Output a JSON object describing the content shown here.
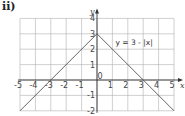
{
  "part_label": "ii)",
  "equation_label": "y = 3 - |x|",
  "axis": {
    "x_label": "x",
    "y_label": "y"
  },
  "colors": {
    "grid": "#b0b0b0",
    "axis": "#333333",
    "line": "#555555"
  },
  "chart_data": {
    "type": "line",
    "title": "",
    "xlabel": "x",
    "ylabel": "y",
    "xlim": [
      -5,
      5
    ],
    "ylim": [
      -2,
      4
    ],
    "grid": true,
    "x_ticks": [
      -5,
      -4,
      -3,
      -2,
      -1,
      0,
      1,
      2,
      3,
      4,
      5
    ],
    "y_ticks": [
      -2,
      -1,
      1,
      2,
      3,
      4
    ],
    "series": [
      {
        "name": "y = 3 - |x|",
        "x": [
          -5,
          0,
          5
        ],
        "y": [
          -2,
          3,
          -2
        ]
      }
    ],
    "annotations": [
      {
        "text": "y = 3 - |x|",
        "x": 1.2,
        "y": 2.3
      }
    ]
  }
}
